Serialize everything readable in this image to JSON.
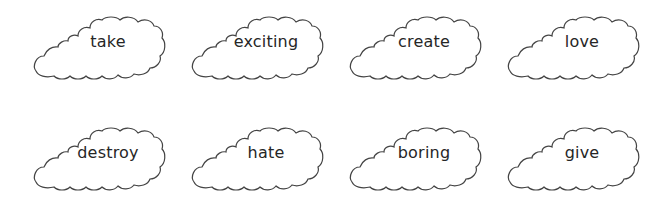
{
  "worksheet": {
    "rows": [
      {
        "clouds": [
          {
            "word": "take"
          },
          {
            "word": "exciting"
          },
          {
            "word": "create"
          },
          {
            "word": "love"
          }
        ]
      },
      {
        "clouds": [
          {
            "word": "destroy"
          },
          {
            "word": "hate"
          },
          {
            "word": "boring"
          },
          {
            "word": "give"
          }
        ]
      }
    ]
  },
  "colors": {
    "outline": "#444444",
    "text": "#262626",
    "background": "#ffffff"
  }
}
